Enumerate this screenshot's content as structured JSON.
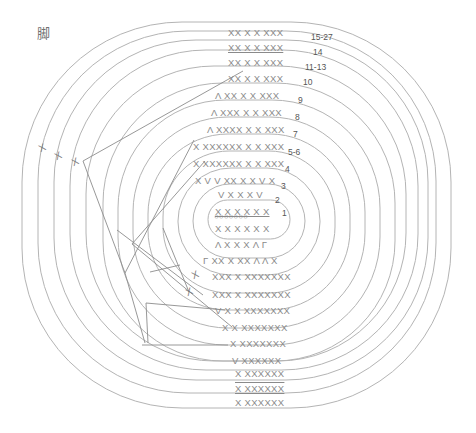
{
  "title_glyph": "脚",
  "rows_top": [
    {
      "label": "15-27",
      "stitches": "XX X X XXX"
    },
    {
      "label": "14",
      "stitches": "XX X X XXX"
    },
    {
      "label": "11-13",
      "stitches": "XX X X XXX"
    },
    {
      "label": "10",
      "stitches": "XX X X XXX"
    },
    {
      "label": "9",
      "stitches": "Λ XX X X XXX"
    },
    {
      "label": "8",
      "stitches": "Λ XXX X X XXX"
    },
    {
      "label": "7",
      "stitches": "Λ XXXX X X XXX"
    },
    {
      "label": "5-6",
      "stitches": "X   XXXXXX X X XXX"
    },
    {
      "label": "4",
      "stitches": "X   XXXXXX X X XXX"
    },
    {
      "label": "3",
      "stitches": "X  V V XX X X V X"
    },
    {
      "label": "2",
      "stitches": "V X X X V"
    },
    {
      "label": "1",
      "stitches": "X X X X X X"
    }
  ],
  "center": {
    "chain": "○○○○○○○",
    "row1_bottom": "X X X X X X"
  },
  "rows_bottom": [
    {
      "stitches": "Λ X X X Λ Γ"
    },
    {
      "stitches": "Γ XX X XX Λ Λ X"
    },
    {
      "stitches": "XXX X XXXXXXX"
    },
    {
      "stitches": "XXX X XXXXXXX"
    },
    {
      "stitches": "V X X XXXXXXX"
    },
    {
      "stitches": "X X XXXXXXX"
    },
    {
      "stitches": "X XXXXXXX"
    },
    {
      "stitches": "V XXXXXX"
    },
    {
      "stitches": "X XXXXXX"
    },
    {
      "stitches": "X XXXXXX"
    },
    {
      "stitches": "X XXXXXX"
    }
  ],
  "side_marks": [
    "X",
    "X",
    "X",
    "X",
    "X"
  ],
  "colors": {
    "ring_stroke": "#b4b4b4",
    "guide_stroke": "#8c8c8c",
    "stitch_text": "#8a8a8a",
    "row_number": "#555555"
  }
}
